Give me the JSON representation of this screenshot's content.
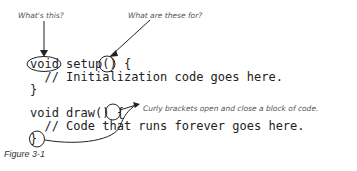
{
  "annotations": {
    "whats_this": "What's this?",
    "what_are_these": "What are these for?",
    "curly_brackets": "Curly brackets open and close a block of code."
  },
  "code": {
    "line1": "void setup() {",
    "line2": "  // Initialization code goes here.",
    "line3": "}",
    "line4": "void draw() {",
    "line5": "  // Code that runs forever goes here.",
    "line6": "}"
  },
  "caption": "Figure 3-1"
}
